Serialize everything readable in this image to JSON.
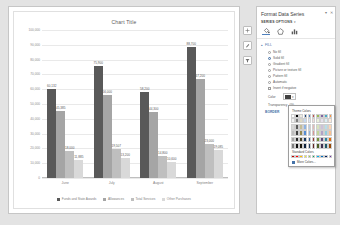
{
  "chart_data": {
    "type": "bar",
    "title": "Chart Title",
    "categories": [
      "June",
      "July",
      "August",
      "September"
    ],
    "series": [
      {
        "name": "Funds and State Awards",
        "color": "#595959",
        "values": [
          60132,
          75900,
          58200,
          88700
        ]
      },
      {
        "name": "Allowances",
        "color": "#a5a5a5",
        "values": [
          45385,
          56000,
          44300,
          67200
        ]
      },
      {
        "name": "Total Services",
        "color": "#bfbfbf",
        "values": [
          18000,
          19507,
          14800,
          23000
        ]
      },
      {
        "name": "Other Purchases",
        "color": "#d9d9d9",
        "values": [
          11885,
          13200,
          10600,
          19085
        ]
      }
    ],
    "value_labels": [
      [
        "60,132",
        "45,385",
        "18,000",
        "11,885"
      ],
      [
        "75,900",
        "56,000",
        "19,507",
        "13,200"
      ],
      [
        "58,200",
        "44,300",
        "14,800",
        "10,600"
      ],
      [
        "88,700",
        "67,200",
        "23,000",
        "19,085"
      ]
    ],
    "yticks": [
      "100,000",
      "90,000",
      "80,000",
      "70,000",
      "60,000",
      "50,000",
      "40,000",
      "30,000",
      "20,000",
      "10,000",
      "0"
    ],
    "ylim": [
      0,
      100000
    ],
    "ylabel": "",
    "xlabel": "",
    "grid": true,
    "legend_position": "bottom"
  },
  "chart_buttons": [
    {
      "name": "chart-elements-button",
      "glyph": "+"
    },
    {
      "name": "chart-styles-button",
      "glyph": "✎"
    },
    {
      "name": "chart-filters-button",
      "glyph": "▽"
    }
  ],
  "pane": {
    "title": "Format Data Series",
    "minimize_glyph": "▾",
    "close_glyph": "✕",
    "series_options_label": "SERIES OPTIONS",
    "series_options_caret": "▾",
    "tabs": [
      {
        "name": "tab-fill-line",
        "glyph": "◔",
        "active": true
      },
      {
        "name": "tab-effects",
        "glyph": "◇",
        "active": false
      },
      {
        "name": "tab-series-options",
        "glyph": "📊",
        "active": false
      }
    ],
    "fill_section": {
      "header": "FILL",
      "caret": "▴",
      "options": [
        {
          "label": "No fill",
          "selected": false
        },
        {
          "label": "Solid fill",
          "selected": true
        },
        {
          "label": "Gradient fill",
          "selected": false
        },
        {
          "label": "Picture or texture fill",
          "selected": false
        },
        {
          "label": "Pattern fill",
          "selected": false
        },
        {
          "label": "Automatic",
          "selected": false
        }
      ],
      "checkbox": {
        "label": "Invert if negative",
        "checked": false
      },
      "color_label": "Color",
      "transparency_label": "Transparency",
      "transparency_value": "0%"
    },
    "border_header": "BORDER"
  },
  "color_picker": {
    "theme_label": "Theme Colors",
    "standard_label": "Standard Colors",
    "more_colors_label": "More Colors...",
    "theme_row": [
      "#ffffff",
      "#000000",
      "#eeece1",
      "#1f497d",
      "#4f81bd",
      "#c0504d",
      "#9bbb59",
      "#8064a2",
      "#4bacc6",
      "#f79646"
    ],
    "theme_shades": [
      [
        "#f2f2f2",
        "#7f7f7f",
        "#ddd9c3",
        "#c6d9f0",
        "#dbe5f1",
        "#f2dcdb",
        "#ebf1dd",
        "#e5e0ec",
        "#dbeef3",
        "#fdeada"
      ],
      [
        "#d8d8d8",
        "#595959",
        "#c4bd97",
        "#8db3e2",
        "#b8cce4",
        "#e5b9b7",
        "#d7e3bc",
        "#ccc1d9",
        "#b7dde8",
        "#fbd5b5"
      ],
      [
        "#bfbfbf",
        "#3f3f3f",
        "#938953",
        "#548dd4",
        "#95b3d7",
        "#d99694",
        "#c3d69b",
        "#b2a2c7",
        "#92cddc",
        "#fac08f"
      ],
      [
        "#a5a5a5",
        "#262626",
        "#494429",
        "#17365d",
        "#366092",
        "#953734",
        "#76923c",
        "#5f497a",
        "#31859b",
        "#e36c09"
      ],
      [
        "#7f7f7f",
        "#0c0c0c",
        "#1d1b10",
        "#0f243e",
        "#244061",
        "#632423",
        "#4f6128",
        "#3f3151",
        "#205867",
        "#974806"
      ]
    ],
    "standard_row": [
      "#c00000",
      "#ff0000",
      "#ffc000",
      "#ffff00",
      "#92d050",
      "#00b050",
      "#00b0f0",
      "#0070c0",
      "#002060",
      "#7030a0"
    ]
  }
}
